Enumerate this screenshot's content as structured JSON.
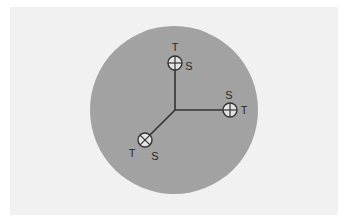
{
  "diagram": {
    "colors": {
      "background": "#ffffff",
      "panel": "#f1f1f1",
      "disc": "#a2a2a2",
      "sensor_fill": "#e4e4e4",
      "line": "#333333"
    },
    "disc": {
      "cx": 174,
      "cy": 110,
      "r": 84
    },
    "junction": {
      "x": 175,
      "y": 110
    },
    "sensors": [
      {
        "id": "top",
        "symbol": "plus-in-circle",
        "cx": 175,
        "cy": 63,
        "r": 7,
        "labels": [
          {
            "text": "T",
            "x": 175,
            "y": 51
          },
          {
            "text": "S",
            "x": 189,
            "y": 70
          }
        ]
      },
      {
        "id": "right",
        "symbol": "plus-in-circle",
        "cx": 230,
        "cy": 110,
        "r": 7,
        "labels": [
          {
            "text": "S",
            "x": 229,
            "y": 99
          },
          {
            "text": "T",
            "x": 244,
            "y": 114
          }
        ]
      },
      {
        "id": "bottom-left",
        "symbol": "x-in-circle",
        "cx": 145,
        "cy": 140,
        "r": 7,
        "labels": [
          {
            "text": "T",
            "x": 132,
            "y": 157
          },
          {
            "text": "S",
            "x": 155,
            "y": 160
          }
        ]
      }
    ]
  }
}
